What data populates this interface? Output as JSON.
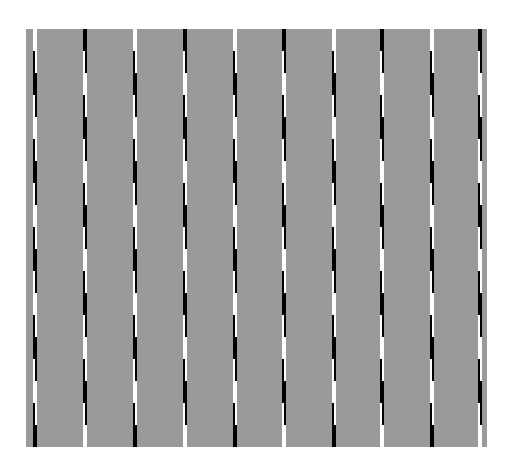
{
  "figure": {
    "type": "cafe-wall-style tilt illusion",
    "background_color": "#9a9a9a",
    "page_color": "#ffffff",
    "line_colors": {
      "dark": "#000000",
      "light": "#ffffff"
    },
    "panel": {
      "x": 26,
      "y": 29,
      "width": 461,
      "height": 418
    },
    "line_count": 10,
    "line_x_positions": [
      7,
      57,
      107,
      157,
      207,
      256,
      306,
      354,
      404,
      452
    ],
    "line_width": 4,
    "segment_height": 22,
    "pattern_cycle": [
      "light",
      "dark-left",
      "dark",
      "dark-right"
    ]
  }
}
